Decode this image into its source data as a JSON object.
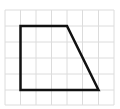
{
  "diagram": {
    "type": "grid-with-polygon",
    "grid": {
      "color": "#dcdcdc",
      "x_lines": [
        5,
        20.5,
        36,
        51.5,
        67,
        82.5,
        98.5,
        114
      ],
      "y_lines": [
        10,
        26,
        42,
        58,
        74,
        90,
        105
      ],
      "columns": 7,
      "rows": 6
    },
    "shape": {
      "name": "trapezoid",
      "stroke": "#111111",
      "stroke_width": 2.5,
      "points_grid": [
        [
          1,
          1
        ],
        [
          4,
          1
        ],
        [
          6,
          5
        ],
        [
          1,
          5
        ]
      ],
      "points_px": "20.5,26 67,26 98.5,90 20.5,90"
    }
  }
}
